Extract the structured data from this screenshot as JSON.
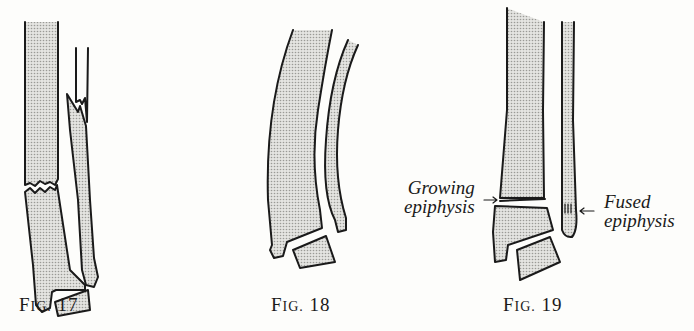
{
  "figures": [
    {
      "id": "fig17",
      "caption_prefix": "F",
      "caption_smallcaps": "IG.",
      "caption_number": "17"
    },
    {
      "id": "fig18",
      "caption_prefix": "F",
      "caption_smallcaps": "IG.",
      "caption_number": "18"
    },
    {
      "id": "fig19",
      "caption_prefix": "F",
      "caption_smallcaps": "IG.",
      "caption_number": "19"
    }
  ],
  "annotations": {
    "growing": {
      "line1": "Growing",
      "line2": "epiphysis",
      "arrow": "→"
    },
    "fused": {
      "line1": "Fused",
      "line2": "epiphysis",
      "arrow": "←"
    }
  },
  "colors": {
    "ink": "#1a1a1a",
    "bone_fill": "#d9d9d6",
    "paper": "#fdfdfb"
  }
}
